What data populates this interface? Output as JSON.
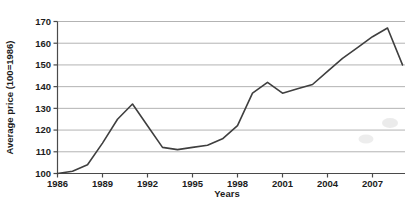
{
  "chart_data": {
    "type": "line",
    "title": "",
    "xlabel": "Years",
    "ylabel": "Average price (100=1986)",
    "x": [
      1986,
      1987,
      1988,
      1989,
      1990,
      1991,
      1992,
      1993,
      1994,
      1995,
      1996,
      1997,
      1998,
      1999,
      2000,
      2001,
      2002,
      2003,
      2004,
      2005,
      2006,
      2007,
      2008,
      2009
    ],
    "series": [
      {
        "name": "Average price index",
        "values": [
          100,
          101,
          104,
          114,
          125,
          132,
          122,
          112,
          111,
          112,
          113,
          116,
          122,
          137,
          142,
          137,
          139,
          141,
          147,
          153,
          158,
          163,
          167,
          150
        ]
      }
    ],
    "ylim": [
      100,
      170
    ],
    "yticks": [
      100,
      110,
      120,
      130,
      140,
      150,
      160,
      170
    ],
    "xticks": [
      1986,
      1989,
      1992,
      1995,
      1998,
      2001,
      2004,
      2007
    ],
    "grid": "horizontal",
    "legend": "none",
    "colors": {
      "line": "#3f3f3f",
      "grid": "#b3b3b3",
      "axis": "#4a4a4a",
      "text": "#1c1c1c",
      "background": "#ffffff",
      "scan_smudge": "#bdbdbd"
    }
  }
}
